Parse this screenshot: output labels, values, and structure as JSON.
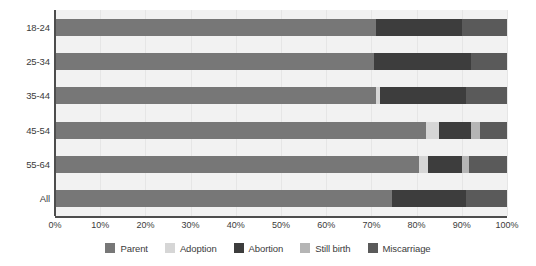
{
  "chart_data": {
    "type": "bar",
    "orientation": "horizontal",
    "stacked": true,
    "normalized": true,
    "title": "",
    "subtitle": "",
    "xlabel": "",
    "ylabel": "",
    "xlim": [
      0,
      100
    ],
    "grid": true,
    "legend_position": "bottom",
    "categories": [
      "18-24",
      "25-34",
      "35-44",
      "45-54",
      "55-64",
      "All"
    ],
    "xticks": [
      0,
      10,
      20,
      30,
      40,
      50,
      60,
      70,
      80,
      90,
      100
    ],
    "xticklabels": [
      "0%",
      "10%",
      "20%",
      "30%",
      "40%",
      "50%",
      "60%",
      "70%",
      "80%",
      "90%",
      "100%"
    ],
    "series": [
      {
        "name": "Parent",
        "color": "#777777",
        "values": [
          71.0,
          70.5,
          71.0,
          82.0,
          80.5,
          74.5
        ]
      },
      {
        "name": "Adoption",
        "color": "#d6d6d6",
        "values": [
          0.0,
          0.0,
          1.0,
          3.0,
          2.0,
          0.0
        ]
      },
      {
        "name": "Abortion",
        "color": "#3d3d3d",
        "values": [
          19.0,
          21.5,
          19.0,
          7.0,
          7.5,
          16.5
        ]
      },
      {
        "name": "Still birth",
        "color": "#b5b5b5",
        "values": [
          0.0,
          0.0,
          0.0,
          2.0,
          1.5,
          0.0
        ]
      },
      {
        "name": "Miscarriage",
        "color": "#5a5a5a",
        "values": [
          10.0,
          8.0,
          9.0,
          6.0,
          8.5,
          9.0
        ]
      }
    ]
  },
  "legend": {
    "items": [
      {
        "label": "Parent",
        "color": "#777777"
      },
      {
        "label": "Adoption",
        "color": "#d6d6d6"
      },
      {
        "label": "Abortion",
        "color": "#3d3d3d"
      },
      {
        "label": "Still birth",
        "color": "#b5b5b5"
      },
      {
        "label": "Miscarriage",
        "color": "#5a5a5a"
      }
    ]
  },
  "colors": {
    "plot_background": "#f2f2f2",
    "gridline": "#e6e6e6",
    "axis": "#4d4d4d",
    "text": "#3b3b3b",
    "page_background": "#ffffff"
  }
}
